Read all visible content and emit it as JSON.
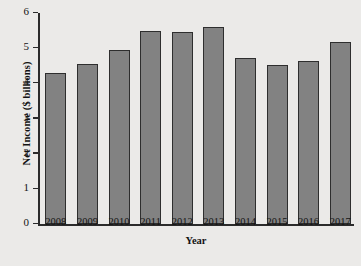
{
  "chart_data": {
    "type": "bar",
    "title": "",
    "xlabel": "Year",
    "ylabel": "Net Income ($ billions)",
    "categories": [
      "2008",
      "2009",
      "2010",
      "2011",
      "2012",
      "2013",
      "2014",
      "2015",
      "2016",
      "2017"
    ],
    "values": [
      4.3,
      4.55,
      4.95,
      5.5,
      5.45,
      5.6,
      4.73,
      4.52,
      4.65,
      5.17
    ],
    "ylim": [
      0,
      6
    ],
    "ytick_labels": [
      "0",
      "1",
      "2",
      "3",
      "4",
      "5",
      "6"
    ],
    "ytick_values": [
      0,
      1,
      2,
      3,
      4,
      5,
      6
    ],
    "grid": false,
    "legend": "none",
    "bar_color": "#828282",
    "bar_edge_color": "#2e2e2e",
    "axis_color": "#2b2b2b",
    "background_color": "#ebeae8"
  }
}
